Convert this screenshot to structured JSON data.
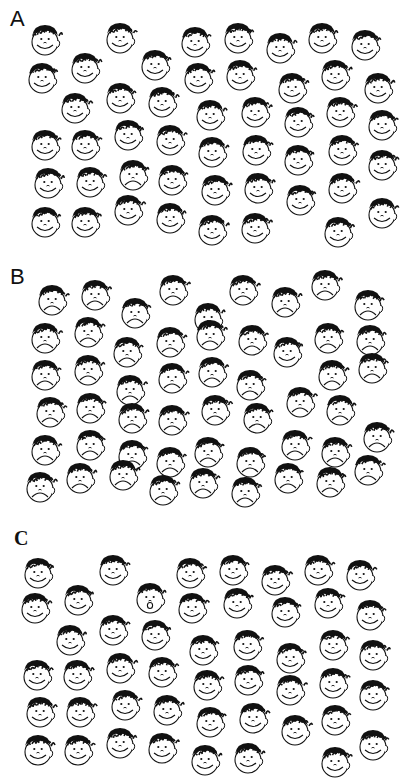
{
  "figure": {
    "panels": [
      {
        "label": "A",
        "label_pos": [
          10,
          8
        ],
        "label_style": "sans",
        "distractor": "happy",
        "target": "sad",
        "faces": [
          [
            45,
            40,
            "happy"
          ],
          [
            120,
            38,
            "happy"
          ],
          [
            195,
            42,
            "happy"
          ],
          [
            238,
            38,
            "happy"
          ],
          [
            280,
            48,
            "happy"
          ],
          [
            322,
            38,
            "happy"
          ],
          [
            365,
            45,
            "happy"
          ],
          [
            42,
            78,
            "happy"
          ],
          [
            85,
            68,
            "happy"
          ],
          [
            155,
            65,
            "happy"
          ],
          [
            198,
            78,
            "happy"
          ],
          [
            240,
            75,
            "happy"
          ],
          [
            292,
            88,
            "happy"
          ],
          [
            335,
            75,
            "happy"
          ],
          [
            378,
            88,
            "happy"
          ],
          [
            75,
            108,
            "happy"
          ],
          [
            120,
            98,
            "happy"
          ],
          [
            162,
            102,
            "happy"
          ],
          [
            210,
            115,
            "happy"
          ],
          [
            255,
            112,
            "happy"
          ],
          [
            298,
            122,
            "happy"
          ],
          [
            340,
            112,
            "happy"
          ],
          [
            382,
            125,
            "happy"
          ],
          [
            45,
            145,
            "happy"
          ],
          [
            85,
            145,
            "happy"
          ],
          [
            128,
            135,
            "happy"
          ],
          [
            170,
            140,
            "happy"
          ],
          [
            212,
            152,
            "happy"
          ],
          [
            256,
            150,
            "happy"
          ],
          [
            298,
            160,
            "happy"
          ],
          [
            342,
            150,
            "happy"
          ],
          [
            382,
            165,
            "happy"
          ],
          [
            48,
            183,
            "happy"
          ],
          [
            90,
            182,
            "happy"
          ],
          [
            133,
            175,
            "sad"
          ],
          [
            172,
            180,
            "happy"
          ],
          [
            215,
            190,
            "happy"
          ],
          [
            258,
            188,
            "happy"
          ],
          [
            300,
            200,
            "happy"
          ],
          [
            342,
            188,
            "happy"
          ],
          [
            45,
            222,
            "happy"
          ],
          [
            85,
            222,
            "happy"
          ],
          [
            128,
            210,
            "happy"
          ],
          [
            170,
            218,
            "happy"
          ],
          [
            212,
            230,
            "happy"
          ],
          [
            255,
            228,
            "happy"
          ],
          [
            338,
            232,
            "happy"
          ],
          [
            382,
            213,
            "happy"
          ]
        ]
      },
      {
        "label": "B",
        "label_pos": [
          10,
          266
        ],
        "label_style": "sans",
        "distractor": "sad",
        "target": "happy",
        "faces": [
          [
            52,
            300,
            "sad"
          ],
          [
            95,
            295,
            "sad"
          ],
          [
            135,
            313,
            "sad"
          ],
          [
            173,
            290,
            "sad"
          ],
          [
            208,
            318,
            "sad"
          ],
          [
            243,
            290,
            "sad"
          ],
          [
            285,
            302,
            "sad"
          ],
          [
            325,
            285,
            "sad"
          ],
          [
            368,
            305,
            "sad"
          ],
          [
            45,
            338,
            "sad"
          ],
          [
            88,
            332,
            "sad"
          ],
          [
            127,
            352,
            "sad"
          ],
          [
            170,
            342,
            "sad"
          ],
          [
            210,
            335,
            "sad"
          ],
          [
            252,
            340,
            "sad"
          ],
          [
            287,
            352,
            "happy"
          ],
          [
            328,
            338,
            "sad"
          ],
          [
            370,
            340,
            "sad"
          ],
          [
            45,
            375,
            "sad"
          ],
          [
            88,
            370,
            "sad"
          ],
          [
            130,
            390,
            "sad"
          ],
          [
            172,
            378,
            "sad"
          ],
          [
            212,
            372,
            "sad"
          ],
          [
            250,
            385,
            "sad"
          ],
          [
            332,
            375,
            "sad"
          ],
          [
            372,
            368,
            "sad"
          ],
          [
            50,
            412,
            "sad"
          ],
          [
            90,
            408,
            "sad"
          ],
          [
            132,
            418,
            "sad"
          ],
          [
            172,
            420,
            "sad"
          ],
          [
            215,
            410,
            "sad"
          ],
          [
            257,
            418,
            "sad"
          ],
          [
            300,
            402,
            "sad"
          ],
          [
            340,
            410,
            "sad"
          ],
          [
            45,
            450,
            "sad"
          ],
          [
            90,
            445,
            "sad"
          ],
          [
            132,
            455,
            "sad"
          ],
          [
            170,
            462,
            "sad"
          ],
          [
            208,
            452,
            "sad"
          ],
          [
            250,
            462,
            "sad"
          ],
          [
            295,
            445,
            "sad"
          ],
          [
            335,
            452,
            "sad"
          ],
          [
            377,
            437,
            "sad"
          ],
          [
            40,
            487,
            "sad"
          ],
          [
            80,
            478,
            "sad"
          ],
          [
            123,
            475,
            "sad"
          ],
          [
            163,
            490,
            "sad"
          ],
          [
            203,
            483,
            "sad"
          ],
          [
            245,
            492,
            "sad"
          ],
          [
            288,
            478,
            "sad"
          ],
          [
            330,
            482,
            "sad"
          ],
          [
            368,
            470,
            "sad"
          ]
        ]
      },
      {
        "label": "C",
        "label_pos": [
          14,
          528
        ],
        "label_style": "serif",
        "distractor": "happy",
        "target": "surprised",
        "faces": [
          [
            38,
            573,
            "happy"
          ],
          [
            113,
            570,
            "happy"
          ],
          [
            190,
            573,
            "happy"
          ],
          [
            233,
            570,
            "happy"
          ],
          [
            275,
            580,
            "happy"
          ],
          [
            318,
            570,
            "happy"
          ],
          [
            360,
            575,
            "happy"
          ],
          [
            35,
            608,
            "happy"
          ],
          [
            78,
            600,
            "happy"
          ],
          [
            150,
            598,
            "surprised"
          ],
          [
            192,
            608,
            "happy"
          ],
          [
            237,
            603,
            "happy"
          ],
          [
            285,
            612,
            "happy"
          ],
          [
            328,
            603,
            "happy"
          ],
          [
            370,
            615,
            "happy"
          ],
          [
            70,
            640,
            "happy"
          ],
          [
            113,
            630,
            "happy"
          ],
          [
            155,
            635,
            "happy"
          ],
          [
            203,
            650,
            "happy"
          ],
          [
            247,
            645,
            "happy"
          ],
          [
            290,
            658,
            "happy"
          ],
          [
            333,
            645,
            "happy"
          ],
          [
            373,
            655,
            "happy"
          ],
          [
            37,
            675,
            "happy"
          ],
          [
            77,
            675,
            "happy"
          ],
          [
            120,
            668,
            "happy"
          ],
          [
            162,
            672,
            "happy"
          ],
          [
            207,
            685,
            "happy"
          ],
          [
            248,
            680,
            "happy"
          ],
          [
            290,
            690,
            "happy"
          ],
          [
            333,
            683,
            "happy"
          ],
          [
            373,
            695,
            "happy"
          ],
          [
            40,
            712,
            "happy"
          ],
          [
            80,
            712,
            "happy"
          ],
          [
            125,
            705,
            "happy"
          ],
          [
            167,
            710,
            "happy"
          ],
          [
            210,
            722,
            "happy"
          ],
          [
            253,
            718,
            "happy"
          ],
          [
            295,
            730,
            "happy"
          ],
          [
            335,
            720,
            "happy"
          ],
          [
            38,
            750,
            "happy"
          ],
          [
            78,
            750,
            "happy"
          ],
          [
            120,
            743,
            "happy"
          ],
          [
            162,
            748,
            "happy"
          ],
          [
            205,
            760,
            "happy"
          ],
          [
            248,
            758,
            "happy"
          ],
          [
            335,
            762,
            "happy"
          ],
          [
            373,
            745,
            "happy"
          ]
        ]
      }
    ],
    "colors": {
      "ink": "#111111",
      "background": "#ffffff"
    }
  }
}
